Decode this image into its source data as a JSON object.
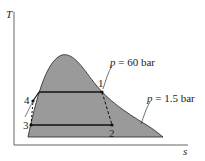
{
  "diagram": {
    "type": "T-s diagram",
    "axes": {
      "y_label": "T",
      "x_label": "s"
    },
    "states": [
      {
        "id": "1",
        "label": "1"
      },
      {
        "id": "2",
        "label": "2"
      },
      {
        "id": "3",
        "label": "3"
      },
      {
        "id": "4",
        "label": "4"
      }
    ],
    "isobars": [
      {
        "label": "p = 60 bar",
        "p_symbol": "p",
        "value_text": " = 60 bar"
      },
      {
        "label": "p = 1.5 bar",
        "p_symbol": "p",
        "value_text": " = 1.5 bar"
      }
    ],
    "colors": {
      "dome_fill": "#9a9a9a",
      "line": "#222222",
      "background": "#ffffff"
    }
  }
}
